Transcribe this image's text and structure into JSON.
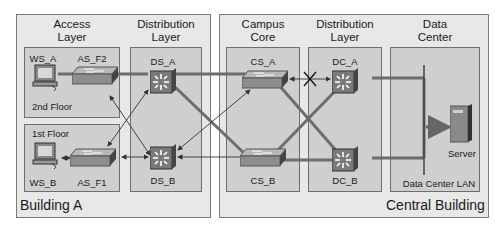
{
  "buildings": {
    "a": {
      "label": "Building A"
    },
    "central": {
      "label": "Central Building"
    }
  },
  "layers": {
    "access": {
      "title_line1": "Access",
      "title_line2": "Layer"
    },
    "distribution_a": {
      "title_line1": "Distribution",
      "title_line2": "Layer"
    },
    "core": {
      "title_line1": "Campus",
      "title_line2": "Core"
    },
    "distribution_c": {
      "title_line1": "Distribution",
      "title_line2": "Layer"
    },
    "datacenter": {
      "title_line1": "Data",
      "title_line2": "Center"
    }
  },
  "floors": {
    "second": "2nd Floor",
    "first": "1st Floor"
  },
  "devices": {
    "ws_a": "WS_A",
    "ws_b": "WS_B",
    "as_f2": "AS_F2",
    "as_f1": "AS_F1",
    "ds_a": "DS_A",
    "ds_b": "DS_B",
    "cs_a": "CS_A",
    "cs_b": "CS_B",
    "dc_a": "DC_A",
    "dc_b": "DC_B",
    "server": "Server"
  },
  "lan_label": "Data Center LAN",
  "colors": {
    "frame_bg": "#e8e8e8",
    "panel_bg": "#cfcfcf",
    "link_thick": "#6d6d6d",
    "switch_top": "#9a9a9a",
    "l3_switch": "#7a7a7a"
  }
}
